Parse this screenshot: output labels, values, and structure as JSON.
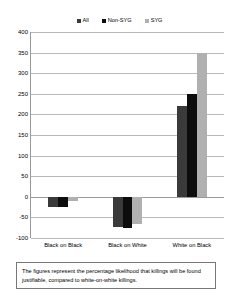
{
  "chart_data": {
    "type": "bar",
    "title": "",
    "xlabel": "",
    "ylabel": "",
    "ylim": [
      -100,
      400
    ],
    "ytick_step": 50,
    "yticks": [
      400,
      350,
      300,
      250,
      200,
      150,
      100,
      50,
      0,
      -50,
      -100
    ],
    "ytick_labels": [
      "400",
      "350",
      "300",
      "250",
      "200",
      "150",
      "100",
      "50",
      "0",
      "-50",
      "-100"
    ],
    "grid": true,
    "legend_position": "top-center",
    "categories": [
      "Black on Black",
      "Black on White",
      "White on Black"
    ],
    "series": [
      {
        "name": "All",
        "color": "#3a3a3a",
        "values": [
          -25,
          -73,
          220
        ]
      },
      {
        "name": "Non-SYG",
        "color": "#0d0d0d",
        "values": [
          -25,
          -75,
          250
        ]
      },
      {
        "name": "SYG",
        "color": "#b0b0b0",
        "values": [
          -10,
          -65,
          350
        ]
      }
    ],
    "caption": "The figures represent the percentage likelihood that killings will be found justifiable, compared to white-on-white killings."
  }
}
